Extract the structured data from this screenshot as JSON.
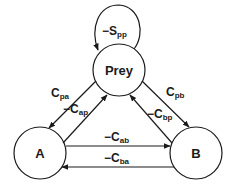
{
  "diagram": {
    "type": "food-web interaction diagram",
    "nodes": [
      {
        "id": "prey",
        "label": "Prey",
        "cx": 119,
        "cy": 70,
        "r": 26
      },
      {
        "id": "a",
        "label": "A",
        "cx": 40,
        "cy": 153,
        "r": 26
      },
      {
        "id": "b",
        "label": "B",
        "cx": 196,
        "cy": 153,
        "r": 26
      }
    ],
    "edges": [
      {
        "id": "spp",
        "from": "prey",
        "to": "prey",
        "sign": "−",
        "base": "S",
        "sub": "pp"
      },
      {
        "id": "cpa",
        "from": "prey",
        "to": "a",
        "sign": "",
        "base": "C",
        "sub": "pa"
      },
      {
        "id": "cap",
        "from": "a",
        "to": "prey",
        "sign": "−",
        "base": "C",
        "sub": "ap"
      },
      {
        "id": "cpb",
        "from": "prey",
        "to": "b",
        "sign": "",
        "base": "C",
        "sub": "pb"
      },
      {
        "id": "cbp",
        "from": "b",
        "to": "prey",
        "sign": "−",
        "base": "C",
        "sub": "bp"
      },
      {
        "id": "cab",
        "from": "a",
        "to": "b",
        "sign": "−",
        "base": "C",
        "sub": "ab"
      },
      {
        "id": "cba",
        "from": "b",
        "to": "a",
        "sign": "−",
        "base": "C",
        "sub": "ba"
      }
    ]
  }
}
